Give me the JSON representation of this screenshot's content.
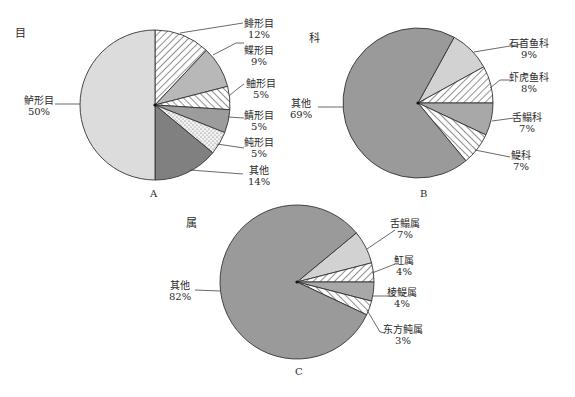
{
  "chart_data": [
    {
      "type": "pie",
      "panel": "A",
      "title": "目",
      "start_angle_deg": 0,
      "direction": "clockwise",
      "categories": [
        "鲱形目",
        "鲽形目",
        "鲉形目",
        "鲭形目",
        "鲀形目",
        "其他",
        "鲈形目"
      ],
      "values": [
        12,
        9,
        5,
        5,
        5,
        14,
        50
      ],
      "labels": [
        "12%",
        "9%",
        "5%",
        "5%",
        "5%",
        "14%",
        "50%"
      ],
      "fills": [
        "hatch-fwd",
        "#b8b8b8",
        "hatch-back",
        "#9c9c9c",
        "dots",
        "#808080",
        "#dcdcdc"
      ]
    },
    {
      "type": "pie",
      "panel": "B",
      "title": "科",
      "start_angle_deg": 28.8,
      "direction": "clockwise",
      "categories": [
        "石首鱼科",
        "虾虎鱼科",
        "舌鳎科",
        "鳀科",
        "其他"
      ],
      "values": [
        9,
        8,
        7,
        7,
        69
      ],
      "labels": [
        "9%",
        "8%",
        "7%",
        "7%",
        "69%"
      ],
      "fills": [
        "#d2d2d2",
        "hatch-fwd",
        "#a8a8a8",
        "hatch-back",
        "#9a9a9a"
      ]
    },
    {
      "type": "pie",
      "panel": "C",
      "title": "属",
      "start_angle_deg": 50.4,
      "direction": "clockwise",
      "categories": [
        "舌鳎属",
        "魟属",
        "棱鳀属",
        "东方鲀属",
        "其他"
      ],
      "values": [
        7,
        4,
        4,
        3,
        82
      ],
      "labels": [
        "7%",
        "4%",
        "4%",
        "3%",
        "82%"
      ],
      "fills": [
        "#d2d2d2",
        "hatch-fwd",
        "#a8a8a8",
        "hatch-back",
        "#9a9a9a"
      ]
    }
  ],
  "panels": {
    "A": {
      "title": "目",
      "caption": "A",
      "labels": [
        {
          "name": "鲱形目",
          "pct": "12%"
        },
        {
          "name": "鲽形目",
          "pct": "9%"
        },
        {
          "name": "鲉形目",
          "pct": "5%"
        },
        {
          "name": "鲭形目",
          "pct": "5%"
        },
        {
          "name": "鲀形目",
          "pct": "5%"
        },
        {
          "name": "其他",
          "pct": "14%"
        },
        {
          "name": "鲈形目",
          "pct": "50%"
        }
      ]
    },
    "B": {
      "title": "科",
      "caption": "B",
      "labels": [
        {
          "name": "石首鱼科",
          "pct": "9%"
        },
        {
          "name": "虾虎鱼科",
          "pct": "8%"
        },
        {
          "name": "舌鳎科",
          "pct": "7%"
        },
        {
          "name": "鳀科",
          "pct": "7%"
        },
        {
          "name": "其他",
          "pct": "69%"
        }
      ]
    },
    "C": {
      "title": "属",
      "caption": "C",
      "labels": [
        {
          "name": "舌鳎属",
          "pct": "7%"
        },
        {
          "name": "魟属",
          "pct": "4%"
        },
        {
          "name": "棱鳀属",
          "pct": "4%"
        },
        {
          "name": "东方鲀属",
          "pct": "3%"
        },
        {
          "name": "其他",
          "pct": "82%"
        }
      ]
    }
  }
}
